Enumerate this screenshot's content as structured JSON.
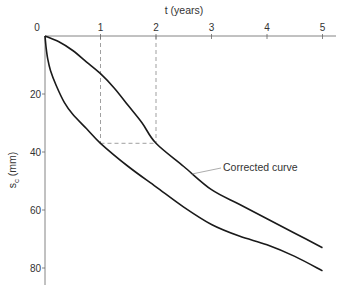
{
  "chart_data": {
    "type": "line",
    "title": "",
    "xlabel": "t (years)",
    "ylabel": "s_c (mm)",
    "xlabel_position": "top",
    "y_axis_inverted": true,
    "xlim": [
      0,
      5.2
    ],
    "ylim": [
      0,
      86
    ],
    "x_ticks": [
      0,
      1,
      2,
      3,
      4,
      5
    ],
    "x_tick_labels": [
      "0",
      "1",
      "2",
      "3",
      "4",
      "5"
    ],
    "y_ticks": [
      20,
      40,
      60,
      80
    ],
    "y_tick_labels": [
      "20",
      "40",
      "60",
      "80"
    ],
    "grid": false,
    "legend": null,
    "series": [
      {
        "name": "Corrected curve",
        "x": [
          0,
          0.25,
          0.5,
          0.75,
          1.0,
          1.25,
          1.5,
          1.75,
          2.0,
          2.5,
          3.0,
          3.5,
          4.0,
          4.5,
          5.0
        ],
        "values": [
          0,
          2,
          5,
          9,
          13,
          18,
          24,
          30,
          37,
          45,
          53,
          58,
          63,
          68,
          73
        ]
      },
      {
        "name": "Instantaneous curve",
        "x": [
          0,
          0.02,
          0.05,
          0.1,
          0.2,
          0.35,
          0.5,
          0.75,
          1.0,
          1.5,
          2.0,
          2.5,
          3.0,
          3.5,
          4.0,
          4.5,
          5.0
        ],
        "values": [
          0,
          4,
          8,
          12,
          17,
          23,
          27,
          32,
          37,
          45,
          52,
          59,
          65,
          69,
          72,
          76,
          81
        ]
      }
    ],
    "construction_lines": [
      {
        "from": [
          1,
          0
        ],
        "to": [
          1,
          37
        ],
        "style": "dashed"
      },
      {
        "from": [
          2,
          0
        ],
        "to": [
          2,
          37
        ],
        "style": "dashed"
      },
      {
        "from": [
          1,
          37
        ],
        "to": [
          2,
          37
        ],
        "style": "dashed"
      }
    ],
    "annotations": [
      {
        "text": "Corrected curve",
        "points_to": [
          2.7,
          47
        ],
        "position": [
          3.2,
          46
        ]
      }
    ]
  },
  "labels": {
    "xlabel": "t (years)",
    "ylabel_main": "s",
    "ylabel_sub": "c",
    "ylabel_unit": " (mm)",
    "annotation": "Corrected curve",
    "origin": "0"
  }
}
